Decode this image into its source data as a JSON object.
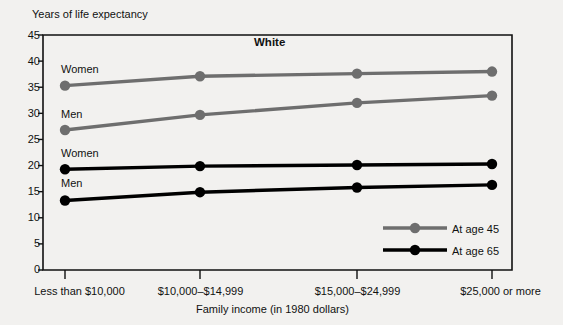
{
  "chart_data": {
    "type": "line",
    "title": "White",
    "xlabel": "Family income (in 1980 dollars)",
    "ylabel": "Years of life expectancy",
    "categories": [
      "Less than $10,000",
      "$10,000–$14,999",
      "$15,000–$24,999",
      "$25,000 or more"
    ],
    "ylim": [
      0,
      45
    ],
    "yticks": [
      0,
      5,
      10,
      15,
      20,
      25,
      30,
      35,
      40,
      45
    ],
    "ytick_labels": [
      "0",
      "5",
      "10",
      "15",
      "20",
      "25",
      "30",
      "35",
      "40",
      "45"
    ],
    "grid": false,
    "legend_position": "inside-bottom-right",
    "series": [
      {
        "name": "Women, at age 45",
        "group": "At age 45",
        "point_label": "Women",
        "color": "#6e6e6e",
        "values": [
          35.3,
          37.1,
          37.6,
          38.0
        ]
      },
      {
        "name": "Men, at age 45",
        "group": "At age 45",
        "point_label": "Men",
        "color": "#6e6e6e",
        "values": [
          26.8,
          29.7,
          32.0,
          33.4
        ]
      },
      {
        "name": "Women, at age 65",
        "group": "At age 65",
        "point_label": "Women",
        "color": "#000000",
        "values": [
          19.3,
          19.9,
          20.1,
          20.3
        ]
      },
      {
        "name": "Men, at age 65",
        "group": "At age 65",
        "point_label": "Men",
        "color": "#000000",
        "values": [
          13.3,
          14.9,
          15.8,
          16.3
        ]
      }
    ],
    "legend": [
      {
        "label": "At age 45",
        "color": "#6e6e6e"
      },
      {
        "label": "At age 65",
        "color": "#000000"
      }
    ]
  },
  "colors": {
    "background": "#f2f1ef",
    "axis": "#111111",
    "age45": "#6e6e6e",
    "age65": "#000000"
  },
  "yticks_text": {
    "t0": "0",
    "t5": "5",
    "t10": "10",
    "t15": "15",
    "t20": "20",
    "t25": "25",
    "t30": "30",
    "t35": "35",
    "t40": "40",
    "t45": "45"
  },
  "xticks_text": {
    "c0": "Less than $10,000",
    "c1": "$10,000–$14,999",
    "c2": "$15,000–$24,999",
    "c3": "$25,000 or more"
  },
  "inline_labels": {
    "women45": "Women",
    "men45": "Men",
    "women65": "Women",
    "men65": "Men"
  },
  "legend_labels": {
    "age45": "At age 45",
    "age65": "At age 65"
  }
}
